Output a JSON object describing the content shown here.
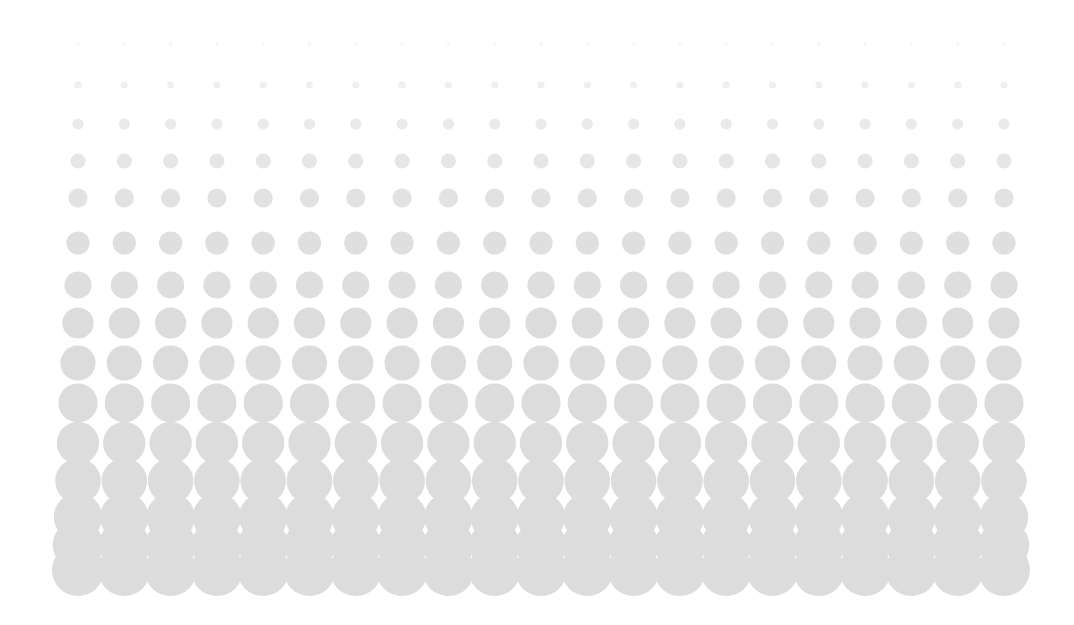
{
  "graphic": {
    "kind": "halftone-dot-gradient",
    "title": "Halftone dot gradient pattern",
    "background_color": "#FFFFFF",
    "dot_color": "#DCDCDC",
    "width": 1074,
    "height": 625
  },
  "chart_data": {
    "type": "scatter",
    "subtitle": "",
    "xlabel": "",
    "ylabel": "",
    "grid": false,
    "legend": null,
    "columns": 21,
    "rows": 15,
    "x_start": 78,
    "x_spacing": 46.3,
    "row_centers_y": [
      44,
      85,
      124,
      161,
      198,
      243,
      285,
      323,
      363,
      403,
      443,
      481,
      517,
      545,
      570
    ],
    "row_radii": [
      1.6,
      3.6,
      5.6,
      7.6,
      9.6,
      11.6,
      13.6,
      15.6,
      17.6,
      19.6,
      21.2,
      22.8,
      24.2,
      25.2,
      26.0
    ],
    "row_opacity": [
      0.3,
      0.45,
      0.6,
      0.72,
      0.82,
      0.9,
      0.95,
      1.0,
      1.0,
      1.0,
      1.0,
      1.0,
      1.0,
      1.0,
      1.0
    ],
    "xlim": [
      0,
      1074
    ],
    "ylim": [
      0,
      625
    ],
    "marker": "circle",
    "marker_color": "#DCDCDC"
  }
}
